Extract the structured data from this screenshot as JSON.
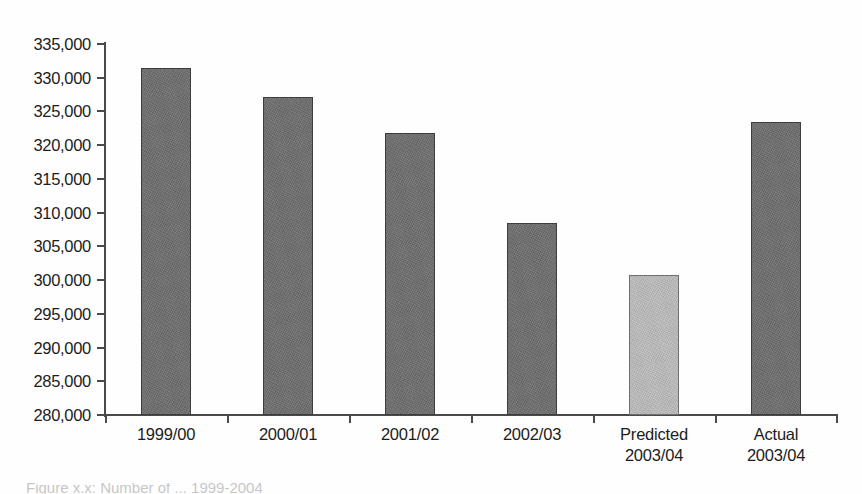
{
  "chart_data": {
    "type": "bar",
    "title": "",
    "subtitle": "",
    "xlabel": "",
    "ylabel": "",
    "categories": [
      "1999/00",
      "2000/01",
      "2001/02",
      "2002/03",
      "Predicted\n2003/04",
      "Actual\n2003/04"
    ],
    "values": [
      331400,
      327200,
      321800,
      308400,
      300800,
      323400
    ],
    "series": [
      {
        "name": "",
        "values": [
          331400,
          327200,
          321800,
          308400,
          300800,
          323400
        ]
      }
    ],
    "ylim": [
      280000,
      335000
    ],
    "yticks": [
      280000,
      285000,
      290000,
      295000,
      300000,
      305000,
      310000,
      315000,
      320000,
      325000,
      330000,
      335000
    ],
    "ytick_labels": [
      "280,000",
      "285,000",
      "290,000",
      "295,000",
      "300,000",
      "305,000",
      "310,000",
      "315,000",
      "320,000",
      "325,000",
      "330,000",
      "335,000"
    ],
    "grid": false,
    "legend": false,
    "legend_position": "none",
    "bar_colors": [
      "#6e6e6e",
      "#6e6e6e",
      "#6e6e6e",
      "#6e6e6e",
      "#bdbdbd",
      "#6e6e6e"
    ],
    "highlighted_index": 4,
    "annotations": []
  },
  "colors": {
    "bar_dark": "#6e6e6e",
    "bar_light": "#bdbdbd",
    "axis": "#4a4a4a",
    "text": "#1c1c1c",
    "background": "#fefefe"
  },
  "caption": {
    "clipped_text": "Figure x.x: Number of ... 1999-2004"
  }
}
